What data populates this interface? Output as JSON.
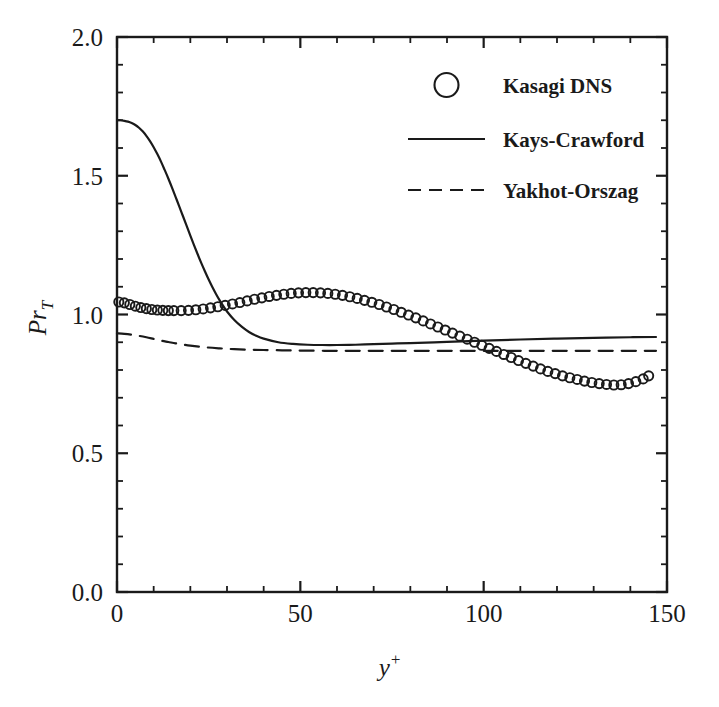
{
  "chart_data": {
    "type": "line",
    "title": "",
    "subtitle": "",
    "xlabel": "y+",
    "xlabel_base": "y",
    "xlabel_sup": "+",
    "ylabel": "PrT",
    "ylabel_base": "Pr",
    "ylabel_sub": "T",
    "xlim": [
      0,
      150
    ],
    "ylim": [
      0.0,
      2.0
    ],
    "x_major_ticks": [
      0,
      50,
      100,
      150
    ],
    "x_major_tick_labels": [
      "0",
      "50",
      "100",
      "150"
    ],
    "x_minor_tick_step": 10,
    "y_major_ticks": [
      0.0,
      0.5,
      1.0,
      1.5,
      2.0
    ],
    "y_major_tick_labels": [
      "0.0",
      "0.5",
      "1.0",
      "1.5",
      "2.0"
    ],
    "y_minor_tick_step": 0.1,
    "grid": false,
    "frame": true,
    "legend_position": "top-right",
    "line_color": "#1a1a1a",
    "series": [
      {
        "name": "Kasagi DNS",
        "style": "markers",
        "marker": "open-circle",
        "x": [
          0.5,
          2.0,
          3.5,
          5.0,
          6.5,
          8.0,
          9.5,
          11.0,
          12.5,
          14.0,
          15.5,
          17.5,
          19.5,
          21.5,
          23.5,
          25.5,
          27.5,
          29.5,
          31.5,
          33.5,
          35.5,
          37.5,
          39.5,
          41.5,
          43.5,
          45.5,
          47.5,
          49.5,
          51.5,
          53.5,
          55.5,
          57.5,
          59.5,
          61.5,
          63.5,
          65.5,
          67.5,
          69.5,
          71.5,
          73.5,
          75.5,
          77.5,
          79.5,
          81.5,
          83.5,
          85.5,
          87.5,
          89.5,
          91.5,
          93.5,
          95.5,
          97.5,
          99.5,
          101.5,
          103.5,
          105.5,
          107.5,
          109.5,
          111.5,
          113.5,
          115.5,
          117.5,
          119.5,
          121.5,
          123.5,
          125.5,
          127.5,
          129.5,
          131.5,
          133.5,
          135.5,
          137.5,
          139.5,
          141.5,
          143.5,
          145.0
        ],
        "y": [
          1.045,
          1.042,
          1.036,
          1.03,
          1.025,
          1.021,
          1.018,
          1.016,
          1.015,
          1.014,
          1.014,
          1.014,
          1.015,
          1.017,
          1.02,
          1.024,
          1.028,
          1.033,
          1.038,
          1.043,
          1.049,
          1.055,
          1.06,
          1.065,
          1.069,
          1.073,
          1.076,
          1.078,
          1.079,
          1.079,
          1.078,
          1.076,
          1.073,
          1.069,
          1.064,
          1.058,
          1.051,
          1.044,
          1.036,
          1.027,
          1.018,
          1.008,
          0.998,
          0.988,
          0.977,
          0.966,
          0.955,
          0.944,
          0.933,
          0.922,
          0.911,
          0.9,
          0.889,
          0.878,
          0.867,
          0.856,
          0.845,
          0.834,
          0.824,
          0.814,
          0.804,
          0.795,
          0.787,
          0.779,
          0.772,
          0.766,
          0.76,
          0.755,
          0.751,
          0.748,
          0.746,
          0.747,
          0.751,
          0.758,
          0.768,
          0.779
        ],
        "notes": "Starts near 1.04 at wall, shallow dip ~1.014 near y+=15, peak ~1.08 near y+=50, crosses 0.9 near y+=97, minimum ~0.746 near y+=135, rises to ~0.78 at y+=145"
      },
      {
        "name": "Kays-Crawford",
        "style": "solid-line",
        "x": [
          0,
          1,
          2,
          3,
          4,
          5,
          6,
          7,
          8,
          9,
          10,
          11,
          12,
          13,
          14,
          15,
          16,
          17,
          18,
          19,
          20,
          21,
          22,
          23,
          24,
          25,
          26,
          27,
          28,
          29,
          30,
          32,
          34,
          36,
          38,
          40,
          44,
          48,
          52,
          56,
          60,
          65,
          70,
          75,
          80,
          90,
          100,
          110,
          120,
          130,
          140,
          147
        ],
        "y": [
          1.7,
          1.7,
          1.698,
          1.695,
          1.69,
          1.683,
          1.673,
          1.66,
          1.644,
          1.625,
          1.603,
          1.578,
          1.551,
          1.521,
          1.49,
          1.457,
          1.423,
          1.389,
          1.354,
          1.319,
          1.284,
          1.25,
          1.217,
          1.185,
          1.155,
          1.126,
          1.099,
          1.074,
          1.051,
          1.03,
          1.011,
          0.98,
          0.956,
          0.937,
          0.923,
          0.913,
          0.9,
          0.894,
          0.891,
          0.89,
          0.89,
          0.891,
          0.893,
          0.895,
          0.897,
          0.901,
          0.906,
          0.91,
          0.913,
          0.916,
          0.918,
          0.919
        ],
        "notes": "Starts at 1.70, plateau to y+~4, steep sigmoid drop, minimum ~0.890 near y+=57, slow rise to ~0.92 at right edge"
      },
      {
        "name": "Yakhot-Orszag",
        "style": "dashed-line",
        "x": [
          0,
          2,
          4,
          6,
          8,
          10,
          12,
          14,
          16,
          18,
          20,
          24,
          28,
          32,
          36,
          40,
          45,
          50,
          60,
          70,
          80,
          90,
          100,
          110,
          120,
          130,
          140,
          147
        ],
        "y": [
          0.932,
          0.93,
          0.927,
          0.923,
          0.918,
          0.912,
          0.906,
          0.901,
          0.896,
          0.892,
          0.888,
          0.882,
          0.878,
          0.875,
          0.873,
          0.872,
          0.871,
          0.87,
          0.869,
          0.869,
          0.869,
          0.869,
          0.869,
          0.869,
          0.869,
          0.869,
          0.869,
          0.869
        ],
        "notes": "Starts ~0.93, decays to flat asymptote ~0.87"
      }
    ]
  },
  "legend": {
    "entries": [
      {
        "label": "Kasagi DNS",
        "style": "open-circle"
      },
      {
        "label": "Kays-Crawford",
        "style": "solid-line"
      },
      {
        "label": "Yakhot-Orszag",
        "style": "dashed-line"
      }
    ]
  }
}
